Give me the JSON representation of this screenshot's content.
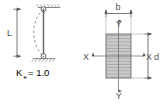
{
  "figure": {
    "background_color": "#ffffff",
    "line_color": "#555555",
    "hatch_color": "#9a9a9a",
    "section_fill": "#c9c9c9"
  },
  "left_panel": {
    "name": "pinned-pinned-column-buckling",
    "length_label": "L",
    "k_symbol": "K",
    "k_subscript": "e",
    "k_equals": "= 1.0",
    "k_full_text": "Ke = 1.0",
    "support_top": "pinned",
    "support_bottom": "pinned",
    "buckled_shape": "single half sine wave bowing left"
  },
  "right_panel": {
    "name": "rectangular-cross-section",
    "width_label": "b",
    "depth_label": "d",
    "axis_x_left": "X",
    "axis_x_right": "X",
    "axis_y_top": "Y",
    "axis_y_bottom": "Y"
  }
}
